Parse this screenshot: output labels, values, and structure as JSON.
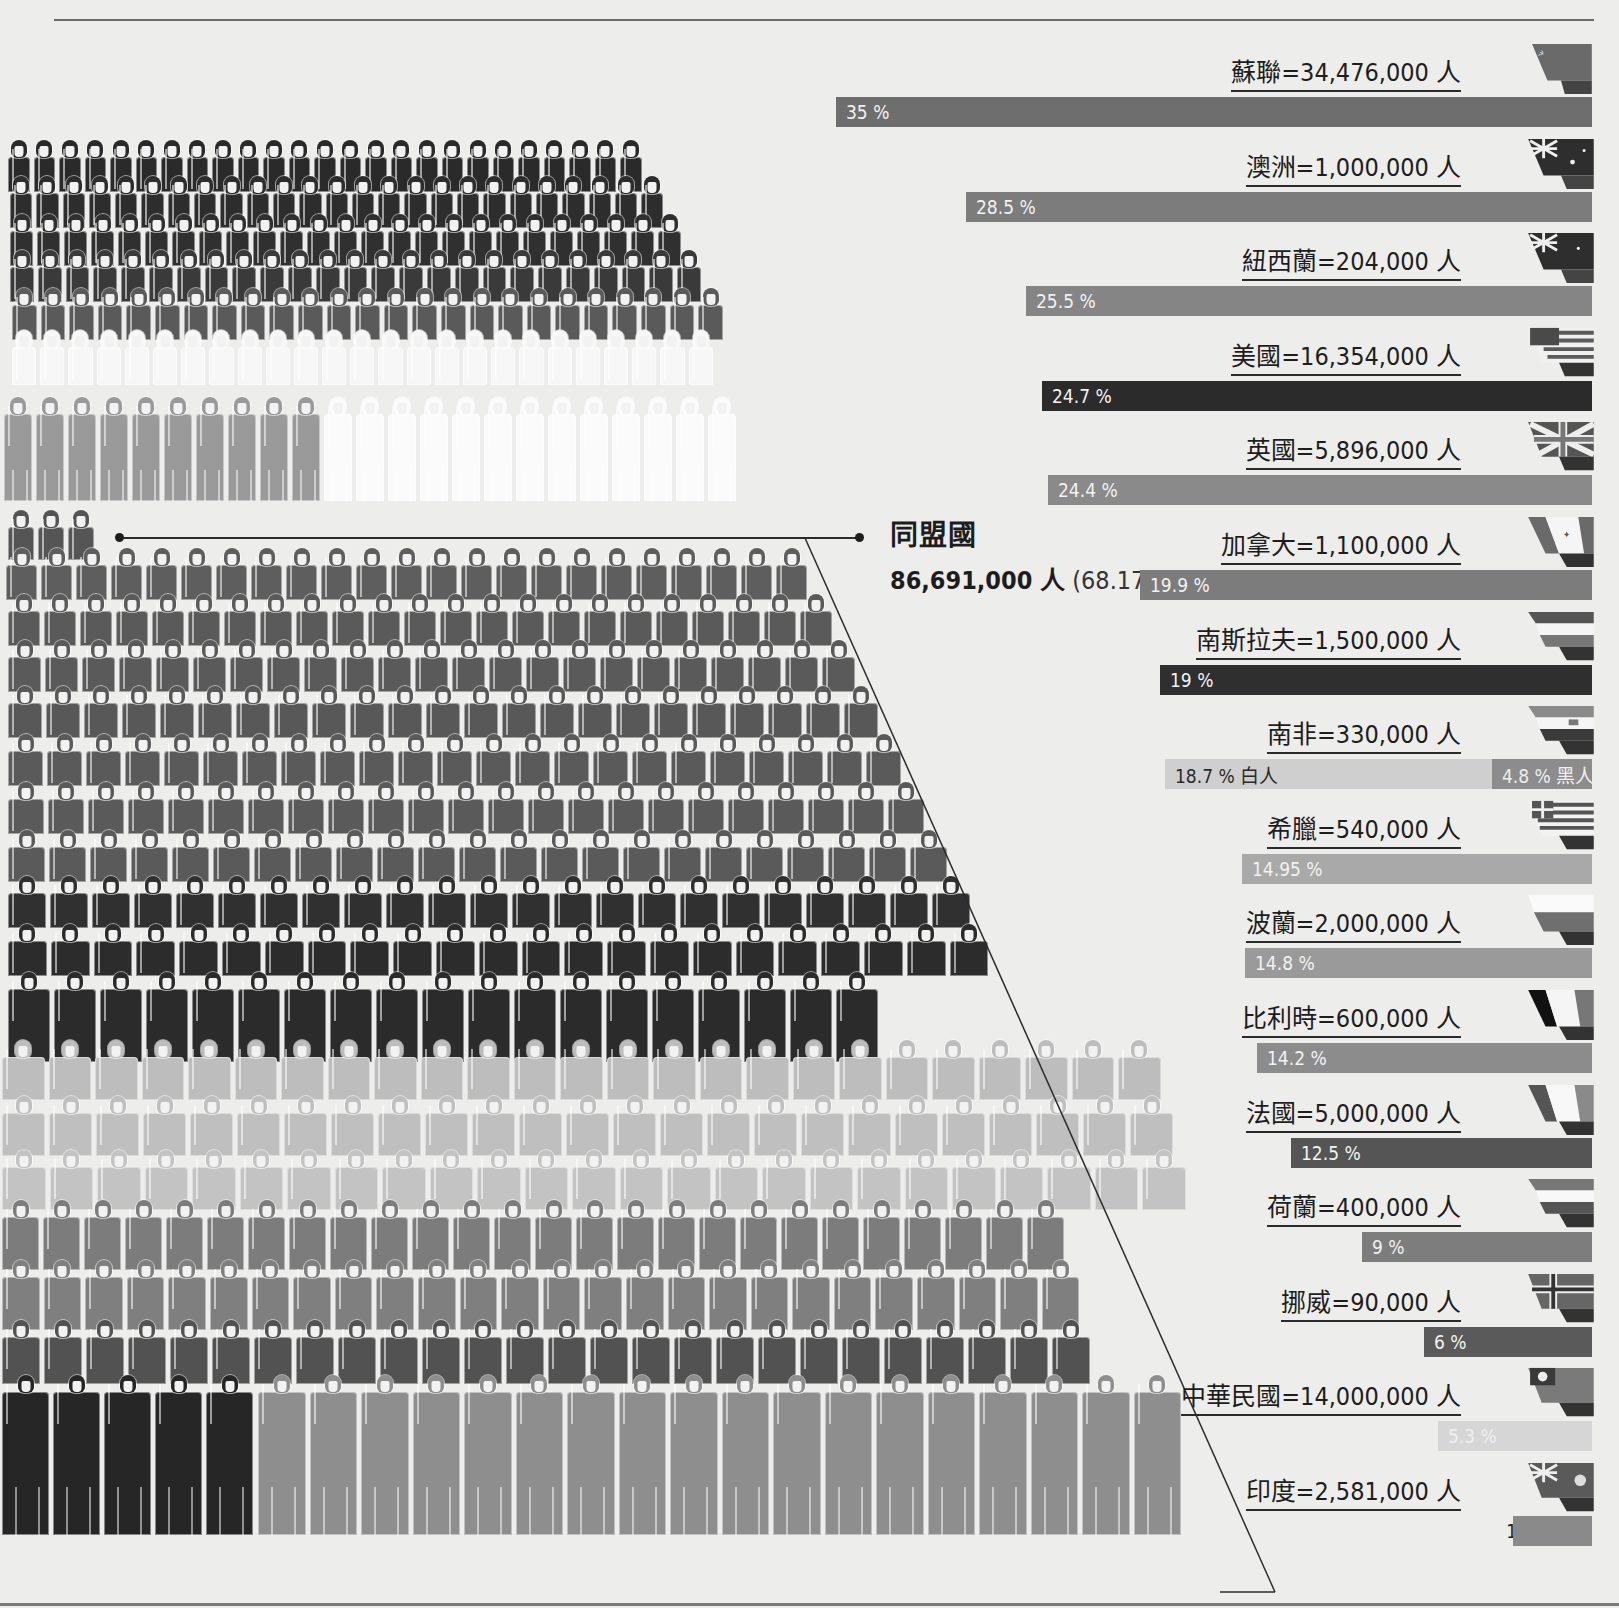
{
  "header": {
    "rule": true
  },
  "summary": {
    "group_label": "同盟國",
    "total_people": "86,691,000 人",
    "total_share": "(68.17 %)"
  },
  "colors": {
    "background": "#ededeb",
    "bar_dark": "#2b2b2b",
    "bar_mid": "#6e6e6e",
    "bar_light": "#9a9a9a",
    "bar_pale": "#c4c4c4",
    "bar_very_pale": "#d9d9d9"
  },
  "countries": [
    {
      "label": "蘇聯=34,476,000 人",
      "pct": "35 %",
      "flag": "ussr-flag-icon"
    },
    {
      "label": "澳洲=1,000,000 人",
      "pct": "28.5 %",
      "flag": "australia-flag-icon"
    },
    {
      "label": "紐西蘭=204,000 人",
      "pct": "25.5 %",
      "flag": "new-zealand-flag-icon"
    },
    {
      "label": "美國=16,354,000 人",
      "pct": "24.7 %",
      "flag": "usa-flag-icon"
    },
    {
      "label": "英國=5,896,000 人",
      "pct": "24.4 %",
      "flag": "uk-flag-icon"
    },
    {
      "label": "加拿大=1,100,000 人",
      "pct": "19.9 %",
      "flag": "canada-flag-icon"
    },
    {
      "label": "南斯拉夫=1,500,000 人",
      "pct": "19 %",
      "flag": "yugoslavia-flag-icon"
    },
    {
      "label": "南非=330,000 人",
      "pct": "18.7 % 白人",
      "pct2": "4.8 % 黑人",
      "flag": "south-africa-flag-icon"
    },
    {
      "label": "希臘=540,000 人",
      "pct": "14.95 %",
      "flag": "greece-flag-icon"
    },
    {
      "label": "波蘭=2,000,000 人",
      "pct": "14.8 %",
      "flag": "poland-flag-icon"
    },
    {
      "label": "比利時=600,000 人",
      "pct": "14.2 %",
      "flag": "belgium-flag-icon"
    },
    {
      "label": "法國=5,000,000 人",
      "pct": "12.5 %",
      "flag": "france-flag-icon"
    },
    {
      "label": "荷蘭=400,000 人",
      "pct": "9 %",
      "flag": "netherlands-flag-icon"
    },
    {
      "label": "挪威=90,000 人",
      "pct": "6 %",
      "flag": "norway-flag-icon"
    },
    {
      "label": "中華民國=14,000,000 人",
      "pct": "5.3 %",
      "flag": "roc-flag-icon"
    },
    {
      "label": "印度=2,581,000 人",
      "pct": "1.6 %",
      "flag": "india-flag-icon"
    }
  ],
  "chart_data": {
    "type": "bar",
    "orientation": "horizontal",
    "xlabel": "",
    "ylabel": "",
    "unit": "% of population mobilized",
    "categories": [
      "蘇聯",
      "澳洲",
      "紐西蘭",
      "美國",
      "英國",
      "加拿大",
      "南斯拉夫",
      "南非",
      "希臘",
      "波蘭",
      "比利時",
      "法國",
      "荷蘭",
      "挪威",
      "中華民國",
      "印度"
    ],
    "people": [
      34476000,
      1000000,
      204000,
      16354000,
      5896000,
      1100000,
      1500000,
      330000,
      540000,
      2000000,
      600000,
      5000000,
      400000,
      90000,
      14000000,
      2581000
    ],
    "series": [
      {
        "name": "動員比例 (%)",
        "values": [
          35,
          28.5,
          25.5,
          24.7,
          24.4,
          19.9,
          19,
          18.7,
          14.95,
          14.8,
          14.2,
          12.5,
          9,
          6,
          5.3,
          1.6
        ]
      },
      {
        "name": "南非 黑人 (%)",
        "values": [
          null,
          null,
          null,
          null,
          null,
          null,
          null,
          4.8,
          null,
          null,
          null,
          null,
          null,
          null,
          null,
          null
        ]
      }
    ],
    "annotations": [
      "18.7 % 白人",
      "4.8 % 黑人"
    ],
    "total_people": 86691000,
    "total_share_pct": 68.17,
    "grid": false,
    "legend": "none"
  }
}
